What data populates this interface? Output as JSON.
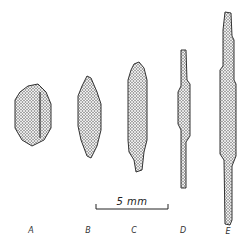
{
  "figure": {
    "specimens": [
      {
        "label": "A",
        "x": 30,
        "top": 85,
        "bottom": 145,
        "width": 36
      },
      {
        "label": "B",
        "x": 89,
        "top": 76,
        "bottom": 158,
        "width": 24
      },
      {
        "label": "C",
        "x": 138,
        "top": 62,
        "bottom": 172,
        "width": 20
      },
      {
        "label": "D",
        "x": 183,
        "top": 48,
        "bottom": 188,
        "width": 12
      },
      {
        "label": "E",
        "x": 227,
        "top": 12,
        "bottom": 225,
        "width": 16
      }
    ],
    "scale_bar": {
      "label": "5 mm",
      "x1": 96,
      "x2": 168,
      "y": 209
    }
  },
  "labels": {
    "a": "A",
    "b": "B",
    "c": "C",
    "d": "D",
    "e": "E"
  },
  "scale_label": "5 mm"
}
